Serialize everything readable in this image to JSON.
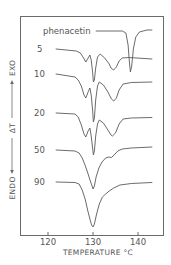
{
  "chart_data": {
    "type": "line",
    "title": "",
    "xlabel": "TEMPERATURE °C",
    "ylabel": "ENDO ← ΔT → EXO",
    "ylabel_parts": {
      "endo": "ENDO",
      "delta": "ΔT",
      "exo": "EXO"
    },
    "xlim": [
      114,
      145.8
    ],
    "x_ticks": [
      120,
      130,
      140
    ],
    "x_tick_labels": [
      "120",
      "130",
      "140"
    ],
    "grid": false,
    "legend": "inline labels at left of each curve",
    "y_units": "arbitrary (ΔT, curves offset vertically)",
    "series": [
      {
        "name": "phenacetin",
        "label": "phenacetin",
        "points": [
          [
            130.7,
            31
          ],
          [
            136.5,
            31
          ],
          [
            137.3,
            33
          ],
          [
            137.8,
            45
          ],
          [
            138.1,
            62
          ],
          [
            138.3,
            72
          ],
          [
            138.6,
            66
          ],
          [
            139.0,
            48
          ],
          [
            139.5,
            37
          ],
          [
            140.3,
            32
          ],
          [
            142.0,
            30
          ],
          [
            143.1,
            30
          ]
        ]
      },
      {
        "name": "5",
        "label": "5",
        "points": [
          [
            121.8,
            49
          ],
          [
            126.3,
            51
          ],
          [
            127.2,
            53
          ],
          [
            127.9,
            58
          ],
          [
            128.4,
            62
          ],
          [
            128.9,
            58
          ],
          [
            129.3,
            55
          ],
          [
            129.6,
            60
          ],
          [
            129.9,
            72
          ],
          [
            130.1,
            82
          ],
          [
            130.3,
            80
          ],
          [
            130.6,
            68
          ],
          [
            131.0,
            57
          ],
          [
            131.6,
            54
          ],
          [
            132.6,
            58
          ],
          [
            133.6,
            64
          ],
          [
            134.0,
            68
          ],
          [
            134.6,
            70
          ],
          [
            135.2,
            67
          ],
          [
            135.8,
            61
          ],
          [
            136.5,
            58
          ],
          [
            138.0,
            57.5
          ],
          [
            143.1,
            59
          ]
        ]
      },
      {
        "name": "10",
        "label": "10",
        "points": [
          [
            121.8,
            74
          ],
          [
            126.0,
            77
          ],
          [
            126.7,
            80
          ],
          [
            127.4,
            86
          ],
          [
            128.0,
            95
          ],
          [
            128.4,
            98
          ],
          [
            128.9,
            92
          ],
          [
            129.3,
            88
          ],
          [
            129.6,
            95
          ],
          [
            129.9,
            110
          ],
          [
            130.1,
            122
          ],
          [
            130.3,
            118
          ],
          [
            130.6,
            100
          ],
          [
            131.0,
            86
          ],
          [
            131.4,
            82
          ],
          [
            132.3,
            85
          ],
          [
            133.3,
            92
          ],
          [
            134.1,
            99
          ],
          [
            134.6,
            101
          ],
          [
            135.2,
            98
          ],
          [
            135.8,
            90
          ],
          [
            136.7,
            84
          ],
          [
            138.5,
            82.5
          ],
          [
            143.1,
            82
          ]
        ]
      },
      {
        "name": "20",
        "label": "20",
        "points": [
          [
            121.8,
            113
          ],
          [
            126.0,
            114
          ],
          [
            126.7,
            117
          ],
          [
            127.4,
            125
          ],
          [
            128.0,
            134
          ],
          [
            128.4,
            137
          ],
          [
            128.9,
            131
          ],
          [
            129.3,
            128
          ],
          [
            129.6,
            136
          ],
          [
            129.9,
            148
          ],
          [
            130.1,
            155
          ],
          [
            130.3,
            151
          ],
          [
            130.6,
            136
          ],
          [
            131.0,
            124
          ],
          [
            131.4,
            120
          ],
          [
            132.3,
            123
          ],
          [
            133.3,
            130
          ],
          [
            134.0,
            135
          ],
          [
            134.3,
            136
          ],
          [
            135.0,
            133
          ],
          [
            135.8,
            124
          ],
          [
            136.7,
            119
          ],
          [
            138.5,
            118
          ],
          [
            143.1,
            117.5
          ]
        ]
      },
      {
        "name": "50",
        "label": "50",
        "points": [
          [
            121.8,
            150
          ],
          [
            126.0,
            151
          ],
          [
            126.9,
            153
          ],
          [
            127.6,
            158
          ],
          [
            128.3,
            166
          ],
          [
            128.9,
            174
          ],
          [
            129.4,
            181
          ],
          [
            129.8,
            186
          ],
          [
            130.0,
            189
          ],
          [
            130.3,
            186
          ],
          [
            130.7,
            177
          ],
          [
            131.3,
            168
          ],
          [
            132.0,
            162
          ],
          [
            132.8,
            158
          ],
          [
            133.5,
            157
          ],
          [
            134.1,
            157.5
          ],
          [
            134.7,
            155
          ],
          [
            135.5,
            151
          ],
          [
            136.5,
            149
          ],
          [
            138.5,
            148
          ],
          [
            143.1,
            147
          ]
        ]
      },
      {
        "name": "90",
        "label": "90",
        "points": [
          [
            121.8,
            182
          ],
          [
            126.0,
            182.5
          ],
          [
            126.9,
            184
          ],
          [
            127.6,
            190
          ],
          [
            128.3,
            200
          ],
          [
            128.8,
            210
          ],
          [
            129.3,
            219
          ],
          [
            129.7,
            225
          ],
          [
            130.0,
            227
          ],
          [
            130.3,
            224
          ],
          [
            130.8,
            214
          ],
          [
            131.4,
            204
          ],
          [
            132.1,
            197
          ],
          [
            132.8,
            194
          ],
          [
            133.6,
            191
          ],
          [
            134.6,
            188
          ],
          [
            136.0,
            185
          ],
          [
            138.5,
            183.5
          ],
          [
            143.1,
            182.5
          ]
        ]
      }
    ],
    "label_positions": {
      "phenacetin": [
        43,
        34
      ],
      "5": [
        37,
        52
      ],
      "10": [
        34,
        77
      ],
      "20": [
        34,
        116
      ],
      "50": [
        34,
        153
      ],
      "90": [
        34,
        185
      ]
    },
    "annotations": []
  }
}
